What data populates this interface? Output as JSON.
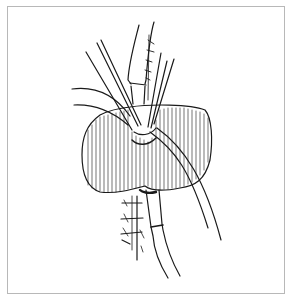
{
  "figure": {
    "kind": "line-illustration",
    "frame_color": "#b8b8b8",
    "ink_color": "#1a1a1a",
    "background": "#ffffff"
  }
}
